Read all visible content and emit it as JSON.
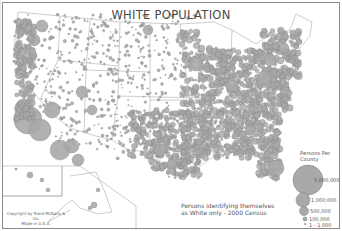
{
  "map": {
    "title": "WHITE POPULATION",
    "caption_line1": "Persons identifying themselves",
    "caption_line2": "as White only - 2000 Census",
    "copyright_line1": "Copyright by Rand McNally & Co.",
    "copyright_line2": "Made in U.S.A.",
    "colors": {
      "symbol_fill": "#a9a9a9",
      "symbol_stroke": "#7d7d7d",
      "boundary": "#9a9a9a",
      "frame": "#8a8a8a"
    },
    "legend": {
      "title_line1": "Persons Per",
      "title_line2": "County",
      "items": [
        {
          "label": "5,000,000"
        },
        {
          "label": "1,000,000"
        },
        {
          "label": "500,000"
        },
        {
          "label": "100,000"
        },
        {
          "label": "1 - 1,000"
        }
      ]
    },
    "insets": [
      "Alaska",
      "Hawaii"
    ]
  }
}
